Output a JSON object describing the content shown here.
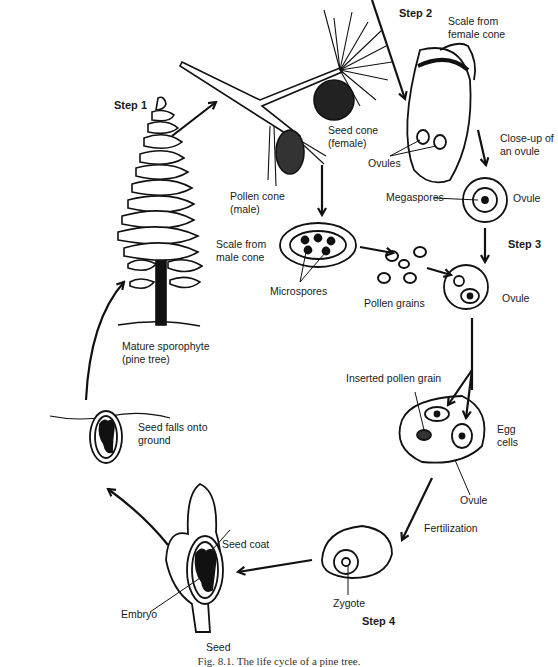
{
  "figure": {
    "caption": "Fig. 8.1. The life cycle of a pine tree."
  },
  "steps": {
    "step1": "Step 1",
    "step2": "Step 2",
    "step3": "Step 3",
    "step4": "Step 4"
  },
  "labels": {
    "scale_female": [
      "Scale from",
      "female cone"
    ],
    "seed_cone": [
      "Seed cone",
      "(female)"
    ],
    "ovules": "Ovules",
    "closeup": [
      "Close-up of",
      "an ovule"
    ],
    "megaspores": "Megaspores",
    "ovule_top": "Ovule",
    "pollen_cone": [
      "Pollen cone",
      "(male)"
    ],
    "scale_male": [
      "Scale from",
      "male cone"
    ],
    "microspores": "Microspores",
    "pollen_grains": "Pollen grains",
    "ovule_step3": "Ovule",
    "mature": [
      "Mature sporophyte",
      "(pine tree)"
    ],
    "inserted_pollen": "Inserted pollen grain",
    "egg_cells": [
      "Egg",
      "cells"
    ],
    "ovule_fert": "Ovule",
    "fertilization": "Fertilization",
    "seed_falls": [
      "Seed falls onto",
      "ground"
    ],
    "seed_coat": "Seed coat",
    "embryo": "Embryo",
    "zygote": "Zygote",
    "seed": "Seed"
  },
  "colors": {
    "ink": "#111111",
    "background": "#ffffff"
  }
}
